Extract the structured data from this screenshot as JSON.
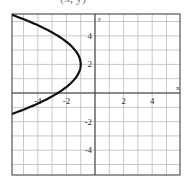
{
  "caption_partial": "(x, y)",
  "chart_data": {
    "type": "line",
    "title": "",
    "xlabel": "x",
    "ylabel": "y",
    "xlim": [
      -6,
      6
    ],
    "ylim": [
      -5.5,
      5.5
    ],
    "grid": true,
    "x_ticks": [
      -4,
      -2,
      2,
      4
    ],
    "y_ticks": [
      4,
      2,
      -2,
      -4
    ],
    "x_tick_labels": [
      "-4",
      "-2",
      "2",
      "4"
    ],
    "y_tick_labels": [
      "4",
      "2",
      "-2",
      "-4"
    ],
    "series": [
      {
        "name": "parabola opening left",
        "equation": "x = -0.4(y-2)^2 - 1",
        "vertex": [
          -1,
          2
        ],
        "points": [
          [
            -5.9,
            5.5
          ],
          [
            -4.6,
            5
          ],
          [
            -2.6,
            4
          ],
          [
            -1.4,
            3
          ],
          [
            -1,
            2
          ],
          [
            -1.4,
            1
          ],
          [
            -2.6,
            0
          ],
          [
            -4.6,
            -1
          ],
          [
            -5.9,
            -1.5
          ]
        ]
      }
    ]
  }
}
